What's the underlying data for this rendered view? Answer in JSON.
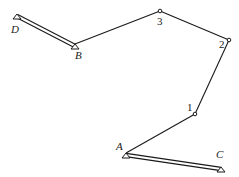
{
  "diagram": {
    "type": "truss / cable structure",
    "colors": {
      "stroke": "#1a1a1a",
      "background": "#ffffff"
    },
    "supports": [
      {
        "id": "D",
        "label": "D",
        "x": 17,
        "y": 14,
        "label_x": 11,
        "label_y": 33
      },
      {
        "id": "B",
        "label": "B",
        "x": 75,
        "y": 44,
        "label_x": 75,
        "label_y": 59
      },
      {
        "id": "A",
        "label": "A",
        "x": 126,
        "y": 153,
        "label_x": 116,
        "label_y": 150
      },
      {
        "id": "C",
        "label": "C",
        "x": 221,
        "y": 167,
        "label_x": 216,
        "label_y": 158
      }
    ],
    "nodes": [
      {
        "id": "1",
        "label": "1",
        "x": 195,
        "y": 114,
        "label_x": 187,
        "label_y": 111
      },
      {
        "id": "2",
        "label": "2",
        "x": 229,
        "y": 40,
        "label_x": 219,
        "label_y": 48
      },
      {
        "id": "3",
        "label": "3",
        "x": 160,
        "y": 11,
        "label_x": 157,
        "label_y": 25
      }
    ],
    "members": [
      {
        "from": "D",
        "to": "B",
        "style": "double"
      },
      {
        "from": "B",
        "to": "3",
        "style": "single"
      },
      {
        "from": "3",
        "to": "2",
        "style": "single"
      },
      {
        "from": "2",
        "to": "1",
        "style": "single"
      },
      {
        "from": "1",
        "to": "A",
        "style": "single"
      },
      {
        "from": "A",
        "to": "C",
        "style": "double"
      }
    ]
  }
}
